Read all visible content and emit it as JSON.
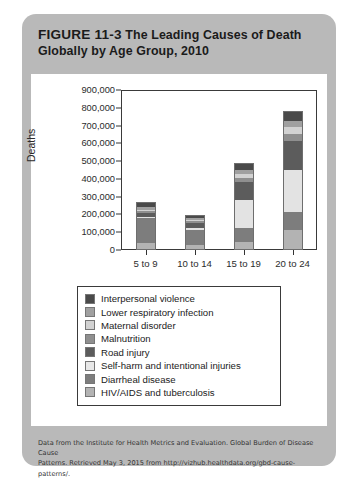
{
  "figure": {
    "number": "FIGURE 11-3",
    "title_line1": "The Leading Causes of Death",
    "title_line2": "Globally by Age Group, 2010"
  },
  "footer": {
    "line1": "Data from the Institute for Health Metrics and Evaluation. Global Burden of Disease Cause",
    "line2": "Patterns. Retrieved May 3, 2015 from http://vizhub.healthdata.org/gbd-cause-patterns/."
  },
  "chart_data": {
    "type": "bar",
    "stacked": true,
    "title": "The Leading Causes of Death Globally by Age Group, 2010",
    "xlabel": "",
    "ylabel": "Deaths",
    "ylim": [
      0,
      900000
    ],
    "ytick_values": [
      0,
      100000,
      200000,
      300000,
      400000,
      500000,
      600000,
      700000,
      800000,
      900000
    ],
    "ytick_labels": [
      "0",
      "100,000",
      "200,000",
      "300,000",
      "400,000",
      "500,000",
      "600,000",
      "700,000",
      "800,000",
      "900,000"
    ],
    "categories": [
      "5 to 9",
      "10 to 14",
      "15 to 19",
      "20 to 24"
    ],
    "grid": false,
    "legend_position": "below-plot",
    "series": [
      {
        "name": "HIV/AIDS and tuberculosis",
        "color": "#b3b3b3",
        "values": [
          35000,
          25000,
          40000,
          110000
        ]
      },
      {
        "name": "Diarrheal disease",
        "color": "#7d7d7d",
        "values": [
          145000,
          90000,
          80000,
          100000
        ]
      },
      {
        "name": "Self-harm and intentional injuries",
        "color": "#e3e3e3",
        "values": [
          5000,
          10000,
          160000,
          240000
        ]
      },
      {
        "name": "Road injury",
        "color": "#5c5c5c",
        "values": [
          28000,
          30000,
          105000,
          165000
        ]
      },
      {
        "name": "Malnutrition",
        "color": "#8f8f8f",
        "values": [
          10000,
          10000,
          25000,
          40000
        ]
      },
      {
        "name": "Maternal disorder",
        "color": "#d2d2d2",
        "values": [
          5000,
          6000,
          22000,
          40000
        ]
      },
      {
        "name": "Lower respiratory infection",
        "color": "#a0a0a0",
        "values": [
          20000,
          12000,
          20000,
          35000
        ]
      },
      {
        "name": "Interpersonal violence",
        "color": "#4a4a4a",
        "values": [
          20000,
          12000,
          40000,
          50000
        ]
      }
    ],
    "totals": [
      268000,
      195000,
      492000,
      780000
    ]
  },
  "legend": {
    "items": [
      {
        "label": "Interpersonal violence",
        "color": "#4a4a4a"
      },
      {
        "label": "Lower respiratory infection",
        "color": "#a0a0a0"
      },
      {
        "label": "Maternal disorder",
        "color": "#d2d2d2"
      },
      {
        "label": "Malnutrition",
        "color": "#8f8f8f"
      },
      {
        "label": "Road injury",
        "color": "#5c5c5c"
      },
      {
        "label": "Self-harm and intentional injuries",
        "color": "#e8e8e8"
      },
      {
        "label": "Diarrheal disease",
        "color": "#7d7d7d"
      },
      {
        "label": "HIV/AIDS and tuberculosis",
        "color": "#b3b3b3"
      }
    ]
  }
}
